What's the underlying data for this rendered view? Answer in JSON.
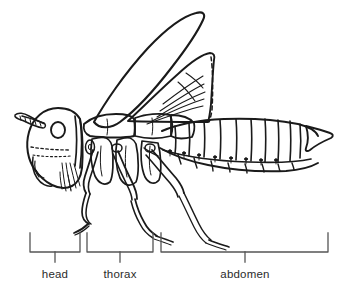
{
  "figure": {
    "background_color": "#ffffff",
    "ink_color": "#1a1a1a",
    "label_color": "#2b2b2b",
    "width": 342,
    "height": 293
  },
  "labels": [
    {
      "id": "head",
      "text": "head",
      "bracket": {
        "x_start": 30,
        "x_end": 80,
        "tick_x": 55,
        "top_y": 233,
        "base_y": 252,
        "tick_y": 262
      }
    },
    {
      "id": "thorax",
      "text": "thorax",
      "bracket": {
        "x_start": 87,
        "x_end": 153,
        "tick_x": 120,
        "top_y": 233,
        "base_y": 252,
        "tick_y": 262
      }
    },
    {
      "id": "abdomen",
      "text": "abdomen",
      "bracket": {
        "x_start": 161,
        "x_end": 328,
        "tick_x": 245,
        "top_y": 233,
        "base_y": 252,
        "tick_y": 262
      }
    }
  ],
  "body_parts": [
    {
      "name": "antenna",
      "region": "head"
    },
    {
      "name": "compound-eye",
      "region": "head"
    },
    {
      "name": "mandible",
      "region": "head"
    },
    {
      "name": "forewing",
      "region": "thorax"
    },
    {
      "name": "hindwing",
      "region": "thorax"
    },
    {
      "name": "foreleg",
      "region": "thorax"
    },
    {
      "name": "midleg",
      "region": "thorax"
    },
    {
      "name": "hindleg",
      "region": "thorax"
    },
    {
      "name": "tergite-segments",
      "region": "abdomen",
      "count": 10
    },
    {
      "name": "sternite-segments",
      "region": "abdomen",
      "count": 8
    },
    {
      "name": "spiracles",
      "region": "abdomen",
      "count": 8
    },
    {
      "name": "cercus-tip",
      "region": "abdomen"
    }
  ]
}
